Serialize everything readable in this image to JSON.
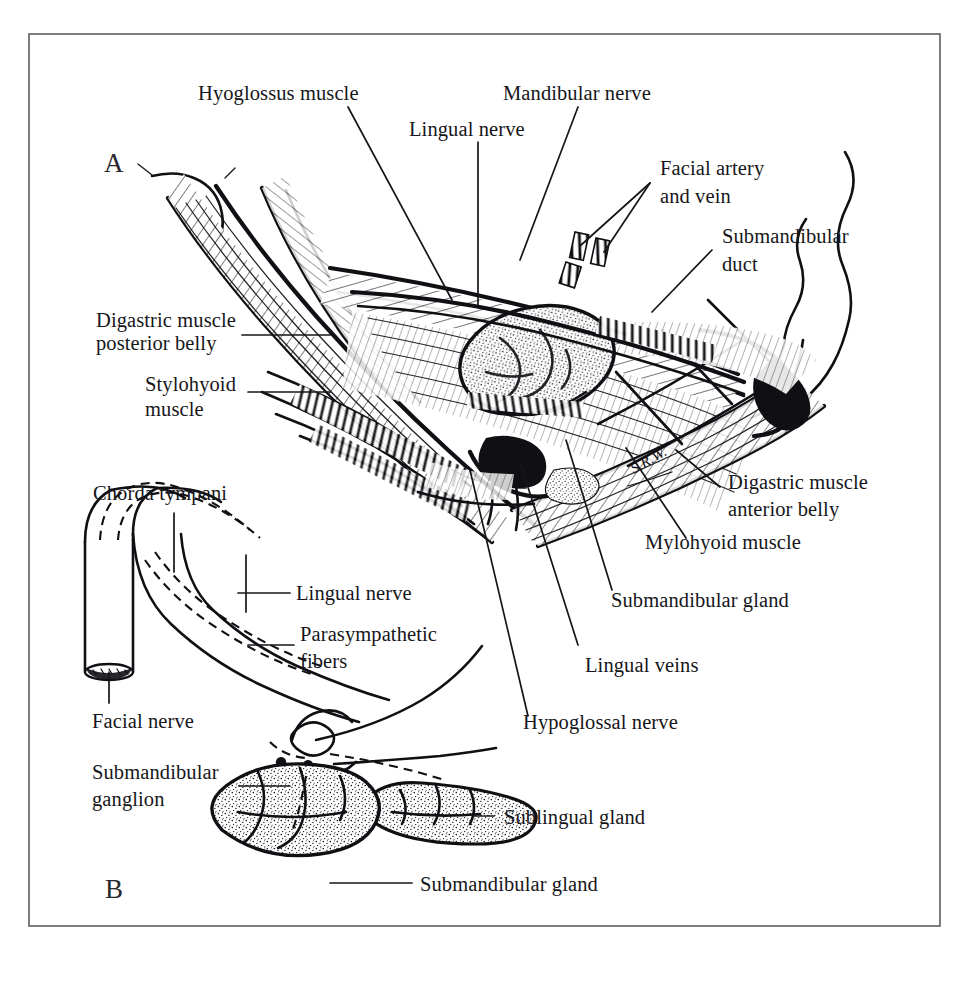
{
  "figure": {
    "kind": "anatomical-line-illustration",
    "panels": [
      {
        "id": "A",
        "label": "A"
      },
      {
        "id": "B",
        "label": "B"
      }
    ],
    "artist_signature": "S.R.W."
  },
  "panel_a": {
    "label": "A",
    "labels": {
      "hyoglossus_muscle": "Hyoglossus muscle",
      "mandibular_nerve": "Mandibular nerve",
      "lingual_nerve": "Lingual nerve",
      "facial_artery_and_vein_line1": "Facial artery",
      "facial_artery_and_vein_line2": "and vein",
      "submandibular_duct_line1": "Submandibular",
      "submandibular_duct_line2": "duct",
      "digastric_posterior_line1": "Digastric muscle",
      "digastric_posterior_line2": "posterior belly",
      "stylohyoid_line1": "Stylohyoid",
      "stylohyoid_line2": "muscle",
      "digastric_anterior_line1": "Digastric muscle",
      "digastric_anterior_line2": "anterior belly",
      "mylohyoid_muscle": "Mylohyoid muscle",
      "submandibular_gland": "Submandibular gland",
      "lingual_veins": "Lingual veins",
      "hypoglossal_nerve": "Hypoglossal nerve"
    }
  },
  "panel_b": {
    "label": "B",
    "labels": {
      "chorda_tympani": "Chorda  tympani",
      "lingual_nerve": "Lingual nerve",
      "parasympathetic_line1": "Parasympathetic",
      "parasympathetic_line2": "fibers",
      "facial_nerve": "Facial nerve",
      "submandibular_ganglion_line1": "Submandibular",
      "submandibular_ganglion_line2": "ganglion",
      "sublingual_gland": "Sublingual gland",
      "submandibular_gland": "Submandibular gland"
    }
  },
  "caption": {
    "text": ""
  },
  "colors": {
    "ink": "#101014",
    "paper": "#ffffff",
    "frame": "#5d5d62",
    "text": "#16161a"
  }
}
